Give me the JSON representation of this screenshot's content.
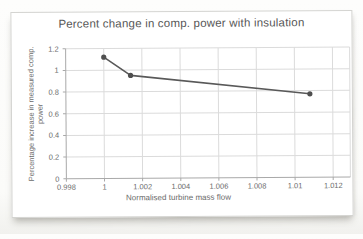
{
  "chart": {
    "title": "Percent change in comp. power with insulation",
    "x_axis_title": "Normalised turbine mass flow",
    "y_axis_title_line1": "Percentage increase in measured comp.",
    "y_axis_title_line2": "power"
  },
  "chart_data": {
    "type": "line",
    "title": "Percent change in comp. power with insulation",
    "xlabel": "Normalised turbine mass flow",
    "ylabel": "Percentage increase in measured comp. power",
    "x": [
      1.0,
      1.0014,
      1.0108
    ],
    "y": [
      1.12,
      0.95,
      0.77
    ],
    "x_ticks": [
      0.998,
      1,
      1.002,
      1.004,
      1.006,
      1.008,
      1.01,
      1.012
    ],
    "y_ticks": [
      0,
      0.2,
      0.4,
      0.6,
      0.8,
      1,
      1.2
    ],
    "xlim": [
      0.998,
      1.0129
    ],
    "ylim": [
      0,
      1.2
    ],
    "grid": true,
    "legend": false,
    "line_width": 1.6,
    "marker": "circle",
    "marker_radius": 2.6
  },
  "colors": {
    "line": "#595959",
    "marker": "#4f4f4f",
    "grid": "#dbdbdb",
    "axis": "#a9a9a9",
    "chart_border": "#d4d4d1",
    "title_text": "#575757",
    "tick_text": "#6b6b6b"
  }
}
